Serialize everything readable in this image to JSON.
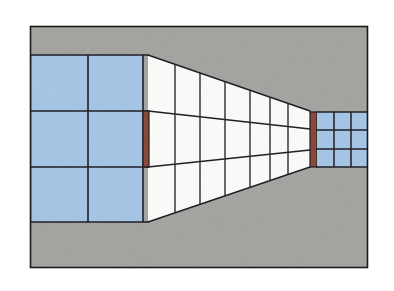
{
  "figure": {
    "title": "One-point perspective interior corridor",
    "canvas": {
      "width": 394,
      "height": 291
    },
    "frame": {
      "x": 30,
      "y": 26,
      "width": 338,
      "height": 242
    }
  },
  "colors": {
    "background": "#ffffff",
    "wall_gray": "#a8a6a2",
    "glass_blue": "#a8c8e8",
    "glass_white": "#fdfdfb",
    "pillar_brown": "#8c4a3a",
    "line_dark": "#1f1f28",
    "frame_border": "#1a1a1a",
    "mullion": "#2a2a33"
  },
  "elements": {
    "outer_frame": {
      "label": "outer picture frame"
    },
    "back_wall": {
      "label": "gray background wall"
    },
    "floor": {
      "label": "gray floor plane"
    },
    "left_glass_wall": {
      "label": "left blue glazed wall",
      "columns": 2,
      "rows": 3,
      "panel_count": 6,
      "color": "#a8c8e8"
    },
    "near_pillar": {
      "label": "near dark red pillar",
      "color": "#8c4a3a"
    },
    "corridor_wall": {
      "label": "white glazed corridor wall in perspective",
      "bays": 6,
      "rows": 3,
      "panel_count": 18,
      "color": "#fdfdfb"
    },
    "far_pillar": {
      "label": "far dark red pillar",
      "color": "#8c4a3a"
    },
    "far_window_grid": {
      "label": "far end blue window grid",
      "columns": 3,
      "rows": 3,
      "panel_count": 9,
      "color": "#a8c8e8"
    },
    "vanishing_point": {
      "x": 330,
      "y": 140,
      "label": "vanishing point"
    }
  },
  "geometry": {
    "corridor_top_near_y": 55,
    "corridor_top_far_y": 111,
    "corridor_bottom_near_y": 222,
    "corridor_bottom_far_y": 167,
    "corridor_mid_upper_near_y": 111,
    "corridor_mid_upper_far_y": 129,
    "corridor_mid_lower_near_y": 167,
    "corridor_mid_lower_far_y": 150,
    "near_x": 148,
    "far_x": 310,
    "mullion_x": [
      148,
      175,
      200,
      225,
      250,
      270,
      288,
      310
    ],
    "left_grid": {
      "x": 32,
      "y": 55,
      "width": 111,
      "height": 167,
      "col_x": [
        32,
        88,
        143
      ],
      "row_y": [
        55,
        111,
        167,
        222
      ]
    },
    "far_grid": {
      "x": 317,
      "y": 112,
      "width": 50,
      "height": 55,
      "col_x": [
        317,
        334,
        351,
        367
      ],
      "row_y": [
        112,
        130,
        149,
        167
      ]
    },
    "near_pillar_rect": {
      "x": 143,
      "y": 111,
      "width": 6,
      "height": 56
    },
    "far_pillar_rect": {
      "x": 310,
      "y": 112,
      "width": 7,
      "height": 55
    }
  }
}
